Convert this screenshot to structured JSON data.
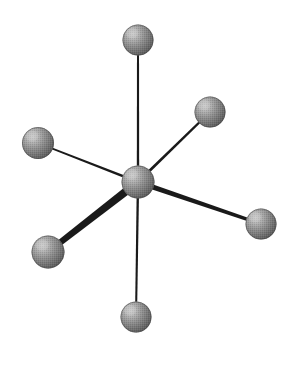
{
  "figure": {
    "width": 295,
    "height": 376,
    "background_color": "#ffffff"
  },
  "palette": {
    "background": "#ffffff",
    "bond_color": "#1a1a1a",
    "sphere_highlight": "#c8c8c8",
    "sphere_midtone": "#8a8a8a",
    "sphere_shadow": "#5a5a5a",
    "sphere_edge": "#4a4a4a"
  },
  "atoms": [
    {
      "id": "central-atom",
      "label": "central atom",
      "cx": 138,
      "cy": 182,
      "r": 16.5,
      "highlight_x": 131,
      "highlight_y": 174
    },
    {
      "id": "ligand-top",
      "label": "top ligand atom",
      "cx": 138,
      "cy": 40,
      "r": 15.5,
      "highlight_x": 132,
      "highlight_y": 33
    },
    {
      "id": "ligand-upper-right",
      "label": "upper-right ligand atom",
      "cx": 210,
      "cy": 112,
      "r": 15.5,
      "highlight_x": 204,
      "highlight_y": 105
    },
    {
      "id": "ligand-right",
      "label": "right ligand atom",
      "cx": 261,
      "cy": 224,
      "r": 15.5,
      "highlight_x": 255,
      "highlight_y": 217
    },
    {
      "id": "ligand-bottom",
      "label": "bottom ligand atom",
      "cx": 136,
      "cy": 317,
      "r": 15.5,
      "highlight_x": 130,
      "highlight_y": 310
    },
    {
      "id": "ligand-lower-left",
      "label": "lower-left ligand atom",
      "cx": 48,
      "cy": 252,
      "r": 16.5,
      "highlight_x": 42,
      "highlight_y": 245
    },
    {
      "id": "ligand-left",
      "label": "left ligand atom",
      "cx": 38,
      "cy": 143,
      "r": 16.0,
      "highlight_x": 32,
      "highlight_y": 136
    }
  ],
  "bonds": [
    {
      "id": "bond-top",
      "label": "bond to top ligand",
      "x1": 138,
      "y1": 182,
      "x2": 138,
      "y2": 40,
      "width_center": 2.4,
      "width_outer": 2.0,
      "depth": "in-plane"
    },
    {
      "id": "bond-upper-right",
      "label": "bond to upper-right ligand",
      "x1": 138,
      "y1": 182,
      "x2": 210,
      "y2": 112,
      "width_center": 3.0,
      "width_outer": 2.2,
      "depth": "behind"
    },
    {
      "id": "bond-right",
      "label": "bond to right ligand",
      "x1": 138,
      "y1": 182,
      "x2": 261,
      "y2": 224,
      "width_center": 5.4,
      "width_outer": 3.2,
      "depth": "front"
    },
    {
      "id": "bond-bottom",
      "label": "bond to bottom ligand",
      "x1": 138,
      "y1": 182,
      "x2": 136,
      "y2": 317,
      "width_center": 2.4,
      "width_outer": 2.0,
      "depth": "in-plane"
    },
    {
      "id": "bond-lower-left",
      "label": "bond to lower-left ligand",
      "x1": 138,
      "y1": 182,
      "x2": 48,
      "y2": 252,
      "width_center": 8.5,
      "width_outer": 6.0,
      "depth": "front"
    },
    {
      "id": "bond-left",
      "label": "bond to left ligand",
      "x1": 138,
      "y1": 182,
      "x2": 38,
      "y2": 143,
      "width_center": 2.6,
      "width_outer": 1.8,
      "depth": "behind"
    }
  ],
  "geometry": {
    "name": "octahedral",
    "coordination_number": 6,
    "ligand_count": 6,
    "central_atom_count": 1
  }
}
